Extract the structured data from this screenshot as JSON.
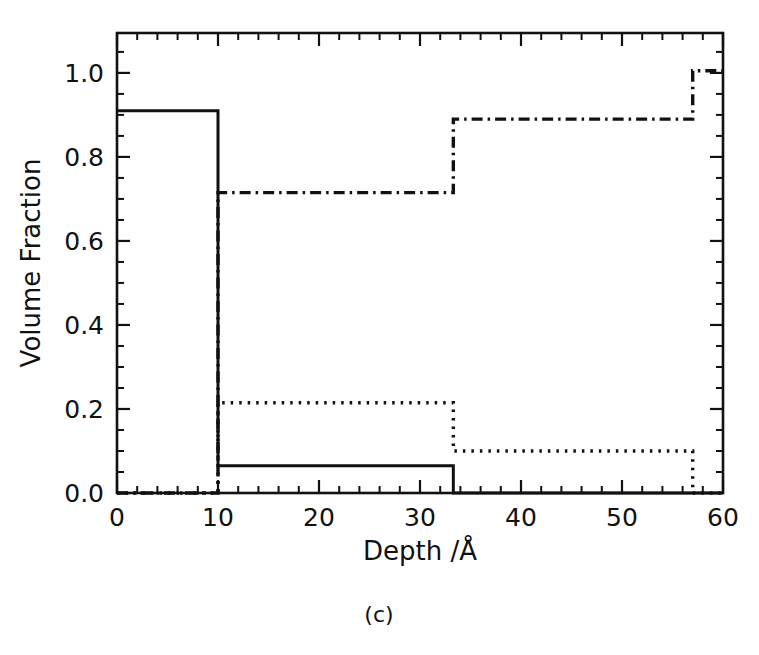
{
  "figure": {
    "caption": "(c)"
  },
  "chart_data": {
    "type": "line",
    "title": "",
    "xlabel": "Depth /Å",
    "ylabel": "Volume Fraction",
    "xlim": [
      0,
      60
    ],
    "ylim": [
      0,
      1.095
    ],
    "xticks": [
      0,
      10,
      20,
      30,
      40,
      50,
      60
    ],
    "xticklabels": [
      "0",
      "10",
      "20",
      "30",
      "40",
      "50",
      "60"
    ],
    "xminor_step": 2,
    "yticks": [
      0.0,
      0.2,
      0.4,
      0.6,
      0.8,
      1.0
    ],
    "yticklabels": [
      "0.0",
      "0.2",
      "0.4",
      "0.6",
      "0.8",
      "1.0"
    ],
    "yminor_step": 0.05,
    "grid": false,
    "legend": null,
    "ticks_direction": "in",
    "frame": "box",
    "step_style": "post",
    "breakpoints": [
      0,
      10,
      33.3,
      57,
      60
    ],
    "series": [
      {
        "name": "solid",
        "linestyle": "solid",
        "color": "#111111",
        "x": [
          0,
          10,
          10,
          33.3,
          33.3,
          60
        ],
        "y": [
          0.91,
          0.91,
          0.065,
          0.065,
          0.0,
          0.0
        ],
        "levels": [
          0.91,
          0.065,
          0.0,
          0.0
        ]
      },
      {
        "name": "dash-dot",
        "linestyle": "dashdot",
        "color": "#111111",
        "x": [
          0,
          10,
          10,
          33.3,
          33.3,
          57,
          57,
          60
        ],
        "y": [
          0.0,
          0.0,
          0.715,
          0.715,
          0.89,
          0.89,
          1.005,
          1.005
        ],
        "levels": [
          0.0,
          0.715,
          0.89,
          1.005
        ]
      },
      {
        "name": "dotted",
        "linestyle": "dotted",
        "color": "#111111",
        "x": [
          0,
          10,
          10,
          33.3,
          33.3,
          57,
          57,
          60
        ],
        "y": [
          0.0,
          0.0,
          0.215,
          0.215,
          0.1,
          0.1,
          0.0,
          0.0
        ],
        "levels": [
          0.0,
          0.215,
          0.1,
          0.0
        ]
      }
    ]
  }
}
